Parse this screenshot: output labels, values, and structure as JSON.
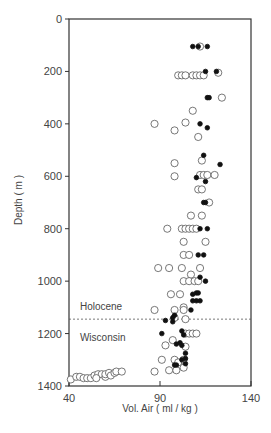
{
  "chart_data": {
    "type": "scatter",
    "title": "",
    "xlabel": "Vol. Air  ( ml / kg )",
    "ylabel": "Depth ( m )",
    "xlim": [
      40,
      140
    ],
    "ylim": [
      1400,
      0
    ],
    "y_inverted": true,
    "x_ticks": [
      40,
      90,
      140
    ],
    "y_ticks": [
      0,
      200,
      400,
      600,
      800,
      1000,
      1200,
      1400
    ],
    "grid": false,
    "annotations": [
      {
        "text": "Holocene",
        "x": 46,
        "y": 1110
      },
      {
        "text": "Wisconsin",
        "x": 46,
        "y": 1230
      }
    ],
    "reference_lines": [
      {
        "type": "horizontal",
        "y": 1145,
        "style": "dashed",
        "label": "Holocene / Wisconsin boundary"
      }
    ],
    "series": [
      {
        "name": "open circles",
        "marker": "open-circle",
        "points": [
          [
            112,
            105
          ],
          [
            122,
            205
          ],
          [
            100,
            215
          ],
          [
            102,
            215
          ],
          [
            104,
            215
          ],
          [
            108,
            215
          ],
          [
            110,
            215
          ],
          [
            112,
            215
          ],
          [
            114,
            215
          ],
          [
            124,
            300
          ],
          [
            108,
            350
          ],
          [
            87,
            400
          ],
          [
            104,
            395
          ],
          [
            98,
            425
          ],
          [
            111,
            450
          ],
          [
            113,
            540
          ],
          [
            98,
            550
          ],
          [
            98,
            600
          ],
          [
            112,
            595
          ],
          [
            114,
            595
          ],
          [
            116,
            595
          ],
          [
            120,
            595
          ],
          [
            111,
            650
          ],
          [
            113,
            650
          ],
          [
            117,
            700
          ],
          [
            107,
            750
          ],
          [
            113,
            750
          ],
          [
            94,
            800
          ],
          [
            102,
            800
          ],
          [
            104,
            800
          ],
          [
            106,
            800
          ],
          [
            108,
            800
          ],
          [
            110,
            800
          ],
          [
            115,
            850
          ],
          [
            103,
            850
          ],
          [
            103,
            900
          ],
          [
            106,
            900
          ],
          [
            89,
            950
          ],
          [
            95,
            950
          ],
          [
            102,
            950
          ],
          [
            112,
            950
          ],
          [
            107,
            975
          ],
          [
            103,
            1000
          ],
          [
            106,
            1000
          ],
          [
            109,
            1000
          ],
          [
            111,
            1000
          ],
          [
            101,
            1050
          ],
          [
            96,
            1050
          ],
          [
            87,
            1110
          ],
          [
            98,
            1110
          ],
          [
            103,
            1100
          ],
          [
            103,
            1110
          ],
          [
            104,
            1145
          ],
          [
            98,
            1140
          ],
          [
            104,
            1200
          ],
          [
            106,
            1200
          ],
          [
            108,
            1200
          ],
          [
            110,
            1200
          ],
          [
            97,
            1225
          ],
          [
            93,
            1245
          ],
          [
            104,
            1250
          ],
          [
            91,
            1300
          ],
          [
            98,
            1300
          ],
          [
            100,
            1310
          ],
          [
            103,
            1300
          ],
          [
            95,
            1340
          ],
          [
            99,
            1340
          ],
          [
            103,
            1330
          ],
          [
            87,
            1345
          ],
          [
            41,
            1375
          ],
          [
            44,
            1365
          ],
          [
            46,
            1365
          ],
          [
            48,
            1370
          ],
          [
            50,
            1370
          ],
          [
            52,
            1370
          ],
          [
            54,
            1360
          ],
          [
            56,
            1355
          ],
          [
            58,
            1355
          ],
          [
            60,
            1365
          ],
          [
            60,
            1355
          ],
          [
            62,
            1350
          ],
          [
            63,
            1360
          ],
          [
            65,
            1350
          ],
          [
            66,
            1345
          ],
          [
            69,
            1345
          ],
          [
            55,
            1370
          ]
        ]
      },
      {
        "name": "filled circles",
        "marker": "filled-circle",
        "points": [
          [
            108,
            105
          ],
          [
            111,
            105
          ],
          [
            116,
            105
          ],
          [
            115,
            200
          ],
          [
            121,
            200
          ],
          [
            116,
            300
          ],
          [
            117,
            300
          ],
          [
            112,
            400
          ],
          [
            116,
            415
          ],
          [
            114,
            520
          ],
          [
            123,
            555
          ],
          [
            110,
            605
          ],
          [
            115,
            620
          ],
          [
            114,
            700
          ],
          [
            115,
            700
          ],
          [
            112,
            800
          ],
          [
            116,
            800
          ],
          [
            111,
            900
          ],
          [
            114,
            900
          ],
          [
            112,
            985
          ],
          [
            115,
            1000
          ],
          [
            108,
            1050
          ],
          [
            110,
            1045
          ],
          [
            111,
            1045
          ],
          [
            108,
            1075
          ],
          [
            110,
            1075
          ],
          [
            112,
            1075
          ],
          [
            107,
            1110
          ],
          [
            98,
            1130
          ],
          [
            97,
            1140
          ],
          [
            93,
            1150
          ],
          [
            97,
            1155
          ],
          [
            91,
            1200
          ],
          [
            102,
            1190
          ],
          [
            103,
            1205
          ],
          [
            101,
            1235
          ],
          [
            99,
            1240
          ],
          [
            102,
            1245
          ],
          [
            104,
            1275
          ],
          [
            104,
            1295
          ],
          [
            102,
            1300
          ],
          [
            104,
            1315
          ],
          [
            99,
            1320
          ],
          [
            98,
            1320
          ]
        ]
      }
    ]
  }
}
